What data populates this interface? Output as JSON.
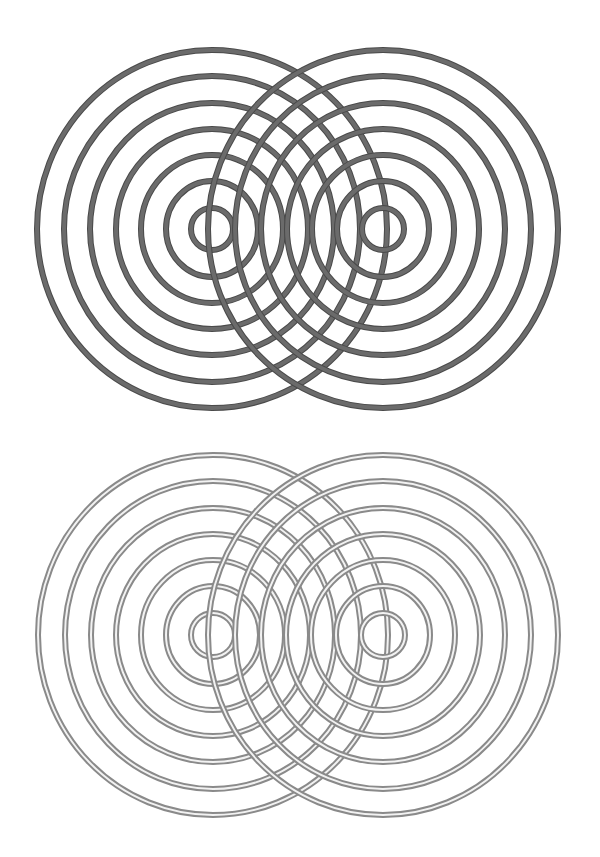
{
  "figure": {
    "panels": [
      {
        "id": "top",
        "style": "solid",
        "stroke_color": "#6b6b6b",
        "edge_color": "#4a4a4a",
        "stroke_width": 6,
        "sources": [
          {
            "cx": 212,
            "cy": 229
          },
          {
            "cx": 383,
            "cy": 229
          }
        ],
        "rings_rx": [
          21,
          46,
          71,
          96,
          122,
          148,
          175
        ],
        "rings_ry": [
          21,
          48,
          74,
          100,
          126,
          153,
          179
        ]
      },
      {
        "id": "bottom",
        "style": "double-line",
        "stroke_color": "#8a8a8a",
        "inner_color": "#f2f2f2",
        "stroke_width": 6,
        "sources": [
          {
            "cx": 213,
            "cy": 205
          },
          {
            "cx": 383,
            "cy": 205
          }
        ],
        "rings_rx": [
          22,
          47,
          72,
          97,
          122,
          148,
          175
        ],
        "rings_ry": [
          22,
          49,
          75,
          101,
          127,
          154,
          180
        ]
      }
    ]
  }
}
